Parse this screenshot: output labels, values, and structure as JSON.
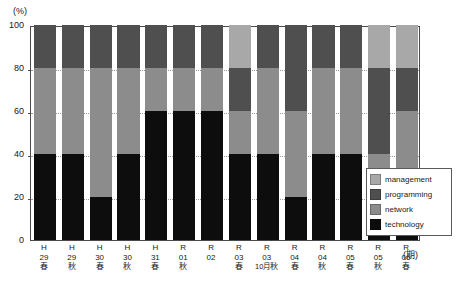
{
  "axis": {
    "y_unit": "(%)",
    "x_unit": "(期)",
    "y_ticks": [
      "100",
      "80",
      "60",
      "40",
      "20",
      "0"
    ]
  },
  "legend": {
    "items": [
      {
        "label": "management",
        "color": "#a8a8a8"
      },
      {
        "label": "programming",
        "color": "#4f4f4f"
      },
      {
        "label": "network",
        "color": "#8c8c8c"
      },
      {
        "label": "technology",
        "color": "#0d0d0d"
      }
    ]
  },
  "chart_data": {
    "type": "bar",
    "title": "",
    "xlabel": "(期)",
    "ylabel": "(%)",
    "ylim": [
      0,
      100
    ],
    "grid": true,
    "stacked": true,
    "stack_mode": "percent",
    "legend_position": "inside-bottom-right",
    "categories": [
      "H29春",
      "H29秋",
      "H30春",
      "H30秋",
      "H31春",
      "R01秋",
      "R02",
      "R03春",
      "R03 10月秋",
      "R04春",
      "R04秋",
      "R05春",
      "R05秋",
      "R06春"
    ],
    "category_labels": [
      {
        "era": "H",
        "year": "29",
        "season": "春",
        "note": ""
      },
      {
        "era": "H",
        "year": "29",
        "season": "秋",
        "note": ""
      },
      {
        "era": "H",
        "year": "30",
        "season": "春",
        "note": ""
      },
      {
        "era": "H",
        "year": "30",
        "season": "秋",
        "note": ""
      },
      {
        "era": "H",
        "year": "31",
        "season": "春",
        "note": ""
      },
      {
        "era": "R",
        "year": "01",
        "season": "秋",
        "note": ""
      },
      {
        "era": "R",
        "year": "02",
        "season": "",
        "note": ""
      },
      {
        "era": "R",
        "year": "03",
        "season": "春",
        "note": ""
      },
      {
        "era": "R",
        "year": "03",
        "season": "秋",
        "note": "10月"
      },
      {
        "era": "R",
        "year": "04",
        "season": "春",
        "note": ""
      },
      {
        "era": "R",
        "year": "04",
        "season": "秋",
        "note": ""
      },
      {
        "era": "R",
        "year": "05",
        "season": "春",
        "note": ""
      },
      {
        "era": "R",
        "year": "05",
        "season": "秋",
        "note": ""
      },
      {
        "era": "R",
        "year": "06",
        "season": "春",
        "note": ""
      }
    ],
    "series": [
      {
        "name": "technology",
        "color": "#0d0d0d",
        "values": [
          40,
          40,
          20,
          40,
          60,
          60,
          60,
          40,
          40,
          20,
          40,
          40,
          10,
          30
        ]
      },
      {
        "name": "network",
        "color": "#8c8c8c",
        "values": [
          40,
          40,
          60,
          40,
          20,
          20,
          20,
          20,
          40,
          40,
          40,
          40,
          30,
          30
        ]
      },
      {
        "name": "programming",
        "color": "#4f4f4f",
        "values": [
          20,
          20,
          20,
          20,
          20,
          20,
          20,
          20,
          20,
          40,
          20,
          20,
          40,
          20
        ]
      },
      {
        "name": "management",
        "color": "#a8a8a8",
        "values": [
          0,
          0,
          0,
          0,
          0,
          0,
          0,
          20,
          0,
          0,
          0,
          0,
          20,
          20
        ]
      }
    ]
  }
}
